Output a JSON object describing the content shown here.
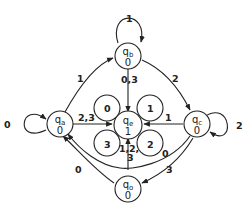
{
  "diagram": {
    "type": "state-transition-diagram",
    "states": [
      {
        "id": "qa",
        "name": "q",
        "sub": "a",
        "output": "0"
      },
      {
        "id": "qb",
        "name": "q",
        "sub": "b",
        "output": "0"
      },
      {
        "id": "qc",
        "name": "q",
        "sub": "c",
        "output": "0"
      },
      {
        "id": "qe",
        "name": "q",
        "sub": "e",
        "output": "1"
      },
      {
        "id": "qo",
        "name": "q",
        "sub": "o",
        "output": "0"
      }
    ],
    "transitions": [
      {
        "from": "qa",
        "to": "qa",
        "label": "0"
      },
      {
        "from": "qa",
        "to": "qb",
        "label": "1"
      },
      {
        "from": "qa",
        "to": "qe",
        "label": "2,3"
      },
      {
        "from": "qb",
        "to": "qb",
        "label": "1"
      },
      {
        "from": "qb",
        "to": "qe",
        "label": "0,3"
      },
      {
        "from": "qb",
        "to": "qc",
        "label": "2"
      },
      {
        "from": "qc",
        "to": "qc",
        "label": "2"
      },
      {
        "from": "qc",
        "to": "qe",
        "label": "1"
      },
      {
        "from": "qc",
        "to": "qa",
        "label": "0"
      },
      {
        "from": "qc",
        "to": "qo",
        "label": "3"
      },
      {
        "from": "qe",
        "to": "qe",
        "label": "0"
      },
      {
        "from": "qe",
        "to": "qe",
        "label": "1"
      },
      {
        "from": "qe",
        "to": "qe",
        "label": "2"
      },
      {
        "from": "qe",
        "to": "qe",
        "label": "3"
      },
      {
        "from": "qo",
        "to": "qe",
        "label": "1,2,3"
      },
      {
        "from": "qo",
        "to": "qa",
        "label": "0"
      }
    ],
    "labels": {
      "qa_self": "0",
      "qa_qb": "1",
      "qa_qe": "2,3",
      "qb_self": "1",
      "qb_qe": "0,3",
      "qb_qc": "2",
      "qc_self": "2",
      "qc_qe": "1",
      "qc_qa": "0",
      "qc_qo": "3",
      "qe_loop0": "0",
      "qe_loop1": "1",
      "qe_loop2": "2",
      "qe_loop3": "3",
      "qo_qe_1": "1,",
      "qo_qe_2": "2,",
      "qo_qe_3": "3",
      "qo_qa": "0"
    }
  }
}
